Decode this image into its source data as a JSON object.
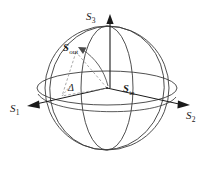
{
  "figure": {
    "name": "poincare-sphere-diagram",
    "background_color": "#ffffff",
    "line_color": "#3c3c3c",
    "dashed_color": "#8c8c8c",
    "text_color": "#1a1a1a"
  },
  "axes": [
    {
      "id": "s3",
      "base": "S",
      "sub": "3",
      "direction": "up",
      "label": "S3"
    },
    {
      "id": "s1",
      "base": "S",
      "sub": "1",
      "direction": "left",
      "label": "S1"
    },
    {
      "id": "s2",
      "base": "S",
      "sub": "2",
      "direction": "right",
      "label": "S2"
    }
  ],
  "vectors": [
    {
      "id": "s-out",
      "base": "S",
      "sub": "out",
      "label": "Sout",
      "style": "dashed-with-arrow"
    },
    {
      "id": "s-in",
      "base": "S",
      "sub": "in",
      "label": "Sin",
      "style": "origin-marker"
    }
  ],
  "angle": {
    "id": "delta",
    "symbol": "Δ",
    "label": "Delta"
  },
  "geometry": {
    "center": {
      "x": 107,
      "y": 88
    },
    "sphere_radius": 62,
    "equator": {
      "rx": 70,
      "ry": 17
    },
    "meridian": {
      "rx": 26,
      "ry": 62
    },
    "tilted_circle_rotation_deg": 12
  }
}
